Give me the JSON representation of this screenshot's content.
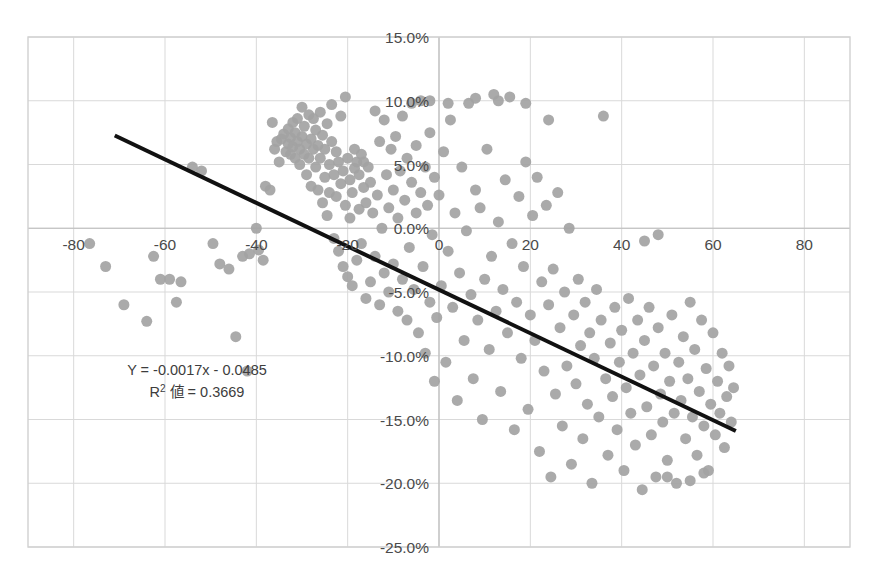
{
  "chart_data": {
    "type": "scatter",
    "title": "",
    "xlabel": "",
    "ylabel": "",
    "xlim": [
      -90,
      90
    ],
    "ylim": [
      -0.25,
      0.15
    ],
    "grid": true,
    "legend": "none",
    "x_ticks": [
      -80,
      -60,
      -40,
      -20,
      0,
      20,
      40,
      60,
      80
    ],
    "x_tick_labels": [
      "-80",
      "-60",
      "-40",
      "-20",
      "0",
      "20",
      "40",
      "60",
      "80"
    ],
    "y_ticks": [
      0.15,
      0.1,
      0.05,
      0.0,
      -0.05,
      -0.1,
      -0.15,
      -0.2,
      -0.25
    ],
    "y_tick_labels": [
      "15.0%",
      "10.0%",
      "5.0%",
      "0.0%",
      "-5.0%",
      "-10.0%",
      "-15.0%",
      "-20.0%",
      "-25.0%"
    ],
    "marker_color": "#a3a3a3",
    "marker_size": 11,
    "trendline": {
      "color": "#111111",
      "width": 4,
      "x_start": -71,
      "y_start": 0.0727,
      "x_end": 65,
      "y_end": -0.159
    },
    "annotation": {
      "equation": "Y = -0.0017x - 0.0485",
      "r_squared_prefix": "R",
      "r_squared_sup": "2",
      "r_squared_label": " 値 = 0.3669",
      "r_squared_value": "0.3669",
      "slope": -0.0017,
      "intercept": -0.0485,
      "x": -53,
      "y": -0.115
    },
    "points": [
      [
        -76.5,
        -0.012
      ],
      [
        -73.0,
        -0.03
      ],
      [
        -69.0,
        -0.06
      ],
      [
        -64.0,
        -0.073
      ],
      [
        -62.5,
        -0.022
      ],
      [
        -61.0,
        -0.04
      ],
      [
        -59.0,
        -0.04
      ],
      [
        -57.5,
        -0.058
      ],
      [
        -56.5,
        -0.042
      ],
      [
        -54.0,
        0.048
      ],
      [
        -52.0,
        0.045
      ],
      [
        -49.5,
        -0.012
      ],
      [
        -48.0,
        -0.028
      ],
      [
        -46.0,
        -0.032
      ],
      [
        -44.5,
        -0.085
      ],
      [
        -43.0,
        -0.022
      ],
      [
        -42.0,
        -0.112
      ],
      [
        -41.5,
        -0.02
      ],
      [
        -40.0,
        0.0
      ],
      [
        -39.5,
        -0.017
      ],
      [
        -38.5,
        -0.025
      ],
      [
        -38.0,
        0.033
      ],
      [
        -37.0,
        0.03
      ],
      [
        -36.5,
        0.083
      ],
      [
        -36.0,
        0.062
      ],
      [
        -35.5,
        0.068
      ],
      [
        -35.0,
        0.052
      ],
      [
        -34.5,
        0.07
      ],
      [
        -34.0,
        0.074
      ],
      [
        -33.5,
        0.06
      ],
      [
        -33.0,
        0.066
      ],
      [
        -33.0,
        0.078
      ],
      [
        -32.5,
        0.058
      ],
      [
        -32.5,
        0.071
      ],
      [
        -32.0,
        0.064
      ],
      [
        -32.0,
        0.083
      ],
      [
        -31.5,
        0.055
      ],
      [
        -31.5,
        0.075
      ],
      [
        -31.0,
        0.068
      ],
      [
        -31.0,
        0.086
      ],
      [
        -30.5,
        0.05
      ],
      [
        -30.5,
        0.062
      ],
      [
        -30.0,
        0.072
      ],
      [
        -30.0,
        0.095
      ],
      [
        -29.5,
        0.058
      ],
      [
        -29.5,
        0.08
      ],
      [
        -29.0,
        0.042
      ],
      [
        -29.0,
        0.066
      ],
      [
        -28.5,
        0.089
      ],
      [
        -28.5,
        0.055
      ],
      [
        -28.0,
        0.07
      ],
      [
        -28.0,
        0.033
      ],
      [
        -27.5,
        0.062
      ],
      [
        -27.5,
        0.086
      ],
      [
        -27.0,
        0.048
      ],
      [
        -27.0,
        0.077
      ],
      [
        -26.5,
        0.03
      ],
      [
        -26.5,
        0.065
      ],
      [
        -26.0,
        0.055
      ],
      [
        -26.0,
        0.091
      ],
      [
        -25.5,
        0.02
      ],
      [
        -25.5,
        0.073
      ],
      [
        -25.0,
        0.04
      ],
      [
        -25.0,
        0.062
      ],
      [
        -24.5,
        0.01
      ],
      [
        -24.5,
        0.082
      ],
      [
        -24.0,
        0.05
      ],
      [
        -24.0,
        0.028
      ],
      [
        -23.5,
        0.068
      ],
      [
        -23.5,
        0.097
      ],
      [
        -23.0,
        -0.008
      ],
      [
        -23.0,
        0.042
      ],
      [
        -22.5,
        0.025
      ],
      [
        -22.5,
        0.06
      ],
      [
        -22.0,
        -0.018
      ],
      [
        -22.0,
        0.052
      ],
      [
        -21.5,
        0.035
      ],
      [
        -21.5,
        0.088
      ],
      [
        -21.0,
        -0.03
      ],
      [
        -21.0,
        0.045
      ],
      [
        -20.5,
        0.018
      ],
      [
        -20.5,
        0.103
      ],
      [
        -20.0,
        -0.038
      ],
      [
        -20.0,
        0.055
      ],
      [
        -19.5,
        0.008
      ],
      [
        -19.5,
        0.038
      ],
      [
        -19.0,
        -0.045
      ],
      [
        -19.0,
        0.028
      ],
      [
        -18.5,
        0.047
      ],
      [
        -18.5,
        0.062
      ],
      [
        -18.0,
        -0.025
      ],
      [
        -18.0,
        0.052
      ],
      [
        -17.5,
        0.015
      ],
      [
        -17.5,
        0.042
      ],
      [
        -17.0,
        -0.012
      ],
      [
        -17.0,
        0.058
      ],
      [
        -16.5,
        0.032
      ],
      [
        -16.5,
        0.052
      ],
      [
        -16.0,
        -0.055
      ],
      [
        -16.0,
        0.02
      ],
      [
        -15.5,
        0.048
      ],
      [
        -15.0,
        -0.042
      ],
      [
        -15.0,
        0.036
      ],
      [
        -14.5,
        0.012
      ],
      [
        -14.0,
        -0.022
      ],
      [
        -14.0,
        0.092
      ],
      [
        -13.5,
        0.026
      ],
      [
        -13.0,
        -0.06
      ],
      [
        -13.0,
        0.068
      ],
      [
        -12.5,
        0.0
      ],
      [
        -12.0,
        -0.035
      ],
      [
        -12.0,
        0.085
      ],
      [
        -11.5,
        0.042
      ],
      [
        -11.0,
        -0.05
      ],
      [
        -11.0,
        0.016
      ],
      [
        -10.5,
        0.062
      ],
      [
        -10.0,
        -0.028
      ],
      [
        -10.0,
        0.03
      ],
      [
        -9.5,
        0.072
      ],
      [
        -9.0,
        -0.065
      ],
      [
        -9.0,
        0.008
      ],
      [
        -8.5,
        0.045
      ],
      [
        -8.0,
        -0.04
      ],
      [
        -8.0,
        0.088
      ],
      [
        -7.5,
        0.022
      ],
      [
        -7.0,
        -0.072
      ],
      [
        -7.0,
        0.055
      ],
      [
        -6.5,
        -0.015
      ],
      [
        -6.0,
        0.036
      ],
      [
        -6.0,
        0.098
      ],
      [
        -5.5,
        -0.048
      ],
      [
        -5.0,
        0.012
      ],
      [
        -5.0,
        0.065
      ],
      [
        -4.5,
        -0.082
      ],
      [
        -4.0,
        0.028
      ],
      [
        -4.0,
        0.1
      ],
      [
        -3.5,
        -0.03
      ],
      [
        -3.0,
        0.048
      ],
      [
        -3.0,
        -0.098
      ],
      [
        -2.5,
        0.018
      ],
      [
        -2.0,
        -0.058
      ],
      [
        -2.0,
        0.075
      ],
      [
        -1.5,
        -0.005
      ],
      [
        -1.0,
        0.04
      ],
      [
        -1.0,
        -0.12
      ],
      [
        -0.5,
        -0.07
      ],
      [
        0.0,
        0.026
      ],
      [
        0.5,
        -0.045
      ],
      [
        1.0,
        0.06
      ],
      [
        1.5,
        -0.105
      ],
      [
        2.0,
        -0.018
      ],
      [
        2.5,
        0.085
      ],
      [
        3.0,
        -0.062
      ],
      [
        3.5,
        0.012
      ],
      [
        4.0,
        -0.135
      ],
      [
        4.5,
        -0.035
      ],
      [
        5.0,
        0.048
      ],
      [
        5.5,
        -0.088
      ],
      [
        6.0,
        -0.002
      ],
      [
        6.5,
        0.098
      ],
      [
        7.0,
        -0.052
      ],
      [
        7.5,
        -0.118
      ],
      [
        8.0,
        0.03
      ],
      [
        8.5,
        -0.072
      ],
      [
        9.0,
        0.016
      ],
      [
        9.5,
        -0.15
      ],
      [
        10.0,
        -0.04
      ],
      [
        10.5,
        0.062
      ],
      [
        11.0,
        -0.095
      ],
      [
        11.5,
        -0.022
      ],
      [
        12.0,
        0.105
      ],
      [
        12.5,
        -0.065
      ],
      [
        13.0,
        0.005
      ],
      [
        13.5,
        -0.128
      ],
      [
        14.0,
        -0.048
      ],
      [
        14.5,
        0.038
      ],
      [
        15.0,
        -0.082
      ],
      [
        15.5,
        0.103
      ],
      [
        16.0,
        -0.012
      ],
      [
        16.5,
        -0.158
      ],
      [
        17.0,
        -0.058
      ],
      [
        17.5,
        0.025
      ],
      [
        18.0,
        -0.102
      ],
      [
        18.5,
        -0.03
      ],
      [
        19.0,
        0.052
      ],
      [
        19.5,
        -0.142
      ],
      [
        20.0,
        -0.068
      ],
      [
        20.5,
        0.01
      ],
      [
        21.0,
        -0.088
      ],
      [
        21.5,
        0.04
      ],
      [
        22.0,
        -0.175
      ],
      [
        22.5,
        -0.042
      ],
      [
        23.0,
        -0.112
      ],
      [
        23.5,
        0.018
      ],
      [
        24.0,
        -0.06
      ],
      [
        24.5,
        -0.195
      ],
      [
        25.0,
        -0.032
      ],
      [
        25.5,
        -0.13
      ],
      [
        26.0,
        0.028
      ],
      [
        26.5,
        -0.078
      ],
      [
        27.0,
        -0.155
      ],
      [
        27.5,
        -0.05
      ],
      [
        28.0,
        -0.108
      ],
      [
        28.5,
        0.0
      ],
      [
        29.0,
        -0.185
      ],
      [
        29.5,
        -0.068
      ],
      [
        30.0,
        -0.122
      ],
      [
        30.5,
        -0.04
      ],
      [
        31.0,
        -0.092
      ],
      [
        31.5,
        -0.165
      ],
      [
        32.0,
        -0.058
      ],
      [
        32.5,
        -0.138
      ],
      [
        33.0,
        -0.082
      ],
      [
        33.5,
        -0.2
      ],
      [
        34.0,
        -0.102
      ],
      [
        34.5,
        -0.048
      ],
      [
        35.0,
        -0.148
      ],
      [
        35.5,
        -0.072
      ],
      [
        36.0,
        0.088
      ],
      [
        36.5,
        -0.118
      ],
      [
        37.0,
        -0.178
      ],
      [
        37.5,
        -0.09
      ],
      [
        38.0,
        -0.132
      ],
      [
        38.5,
        -0.062
      ],
      [
        39.0,
        -0.158
      ],
      [
        39.5,
        -0.105
      ],
      [
        40.0,
        -0.08
      ],
      [
        40.5,
        -0.19
      ],
      [
        41.0,
        -0.125
      ],
      [
        41.5,
        -0.055
      ],
      [
        42.0,
        -0.145
      ],
      [
        42.5,
        -0.098
      ],
      [
        43.0,
        -0.17
      ],
      [
        43.5,
        -0.072
      ],
      [
        44.0,
        -0.115
      ],
      [
        44.5,
        -0.205
      ],
      [
        45.0,
        -0.088
      ],
      [
        45.5,
        -0.14
      ],
      [
        46.0,
        -0.062
      ],
      [
        46.5,
        -0.162
      ],
      [
        47.0,
        -0.108
      ],
      [
        47.5,
        -0.195
      ],
      [
        48.0,
        -0.078
      ],
      [
        48.5,
        -0.13
      ],
      [
        49.0,
        -0.152
      ],
      [
        49.5,
        -0.098
      ],
      [
        50.0,
        -0.182
      ],
      [
        50.5,
        -0.12
      ],
      [
        51.0,
        -0.068
      ],
      [
        51.5,
        -0.145
      ],
      [
        52.0,
        -0.2
      ],
      [
        52.5,
        -0.105
      ],
      [
        53.0,
        -0.135
      ],
      [
        53.5,
        -0.085
      ],
      [
        54.0,
        -0.165
      ],
      [
        54.5,
        -0.118
      ],
      [
        55.0,
        -0.058
      ],
      [
        55.5,
        -0.148
      ],
      [
        56.0,
        -0.095
      ],
      [
        56.5,
        -0.178
      ],
      [
        57.0,
        -0.128
      ],
      [
        57.5,
        -0.072
      ],
      [
        58.0,
        -0.155
      ],
      [
        58.5,
        -0.11
      ],
      [
        59.0,
        -0.19
      ],
      [
        59.5,
        -0.138
      ],
      [
        60.0,
        -0.082
      ],
      [
        60.5,
        -0.162
      ],
      [
        61.0,
        -0.12
      ],
      [
        61.5,
        -0.145
      ],
      [
        62.0,
        -0.098
      ],
      [
        62.5,
        -0.172
      ],
      [
        63.0,
        -0.132
      ],
      [
        63.5,
        -0.108
      ],
      [
        64.0,
        -0.152
      ],
      [
        64.5,
        -0.125
      ],
      [
        45.0,
        -0.01
      ],
      [
        48.0,
        -0.005
      ],
      [
        24.0,
        0.085
      ],
      [
        19.0,
        0.098
      ],
      [
        13.0,
        0.1
      ],
      [
        8.0,
        0.102
      ],
      [
        2.0,
        0.098
      ],
      [
        -2.0,
        0.1
      ],
      [
        50.0,
        -0.195
      ],
      [
        55.0,
        -0.198
      ],
      [
        58.0,
        -0.192
      ]
    ]
  }
}
